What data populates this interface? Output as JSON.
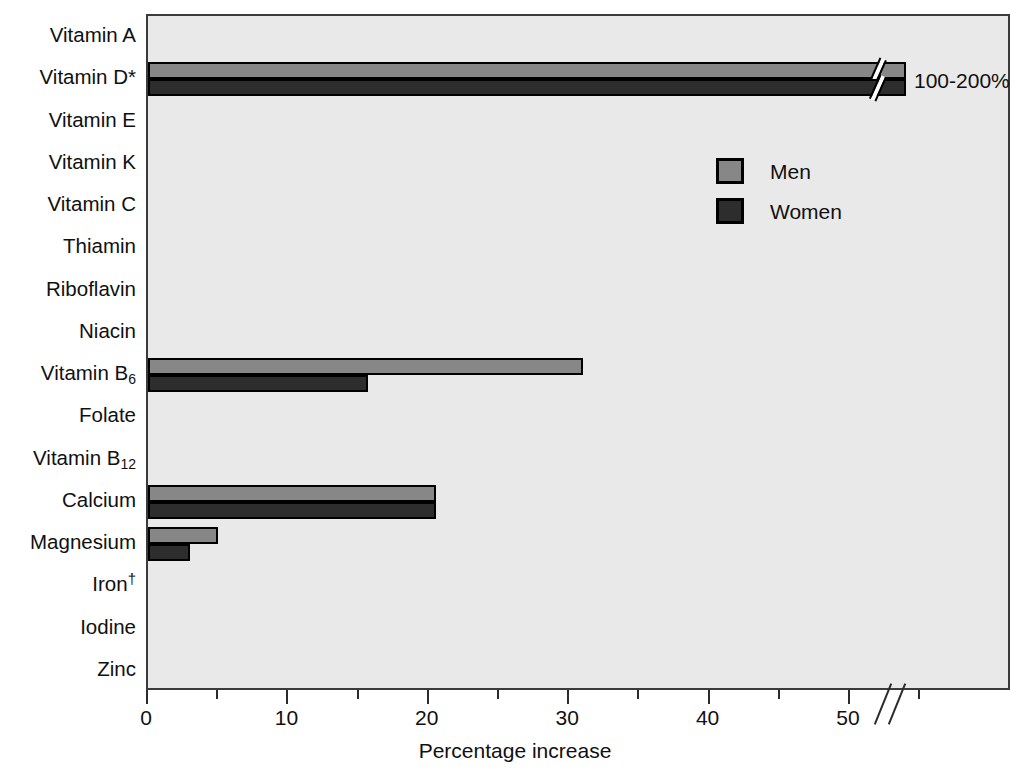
{
  "chart_data": {
    "type": "bar",
    "orientation": "horizontal",
    "title": "",
    "xlabel": "Percentage increase",
    "ylabel": "",
    "xlim": [
      0,
      54
    ],
    "xticks": [
      0,
      5,
      10,
      15,
      20,
      25,
      30,
      35,
      40,
      45,
      50
    ],
    "xtick_labels": [
      "0",
      "10",
      "20",
      "30",
      "40",
      "50"
    ],
    "xtick_label_values": [
      0,
      10,
      20,
      30,
      40,
      50
    ],
    "grid": false,
    "axis_break": {
      "at": 52,
      "label": "100-200%",
      "applies_to": "Vitamin D*"
    },
    "legend": {
      "position": "upper right",
      "entries": [
        "Men",
        "Women"
      ]
    },
    "categories": [
      "Vitamin A",
      "Vitamin D*",
      "Vitamin E",
      "Vitamin K",
      "Vitamin C",
      "Thiamin",
      "Riboflavin",
      "Niacin",
      "Vitamin B6",
      "Folate",
      "Vitamin B12",
      "Calcium",
      "Magnesium",
      "Iron†",
      "Iodine",
      "Zinc"
    ],
    "series": [
      {
        "name": "Men",
        "color": "#878787",
        "values": [
          0,
          54,
          0,
          0,
          0,
          0,
          0,
          0,
          31,
          0,
          0,
          20.5,
          5,
          0,
          0,
          0
        ]
      },
      {
        "name": "Women",
        "color": "#2d2d2d",
        "values": [
          0,
          54,
          0,
          0,
          0,
          0,
          0,
          0,
          15.7,
          0,
          0,
          20.5,
          3,
          0,
          0,
          0
        ]
      }
    ],
    "annotations": [
      {
        "text": "100-200%",
        "category": "Vitamin D*",
        "x": 54.5
      }
    ]
  },
  "categories": [
    {
      "label": "Vitamin A",
      "sub": "",
      "sup": ""
    },
    {
      "label": "Vitamin D*",
      "sub": "",
      "sup": ""
    },
    {
      "label": "Vitamin E",
      "sub": "",
      "sup": ""
    },
    {
      "label": "Vitamin K",
      "sub": "",
      "sup": ""
    },
    {
      "label": "Vitamin C",
      "sub": "",
      "sup": ""
    },
    {
      "label": "Thiamin",
      "sub": "",
      "sup": ""
    },
    {
      "label": "Riboflavin",
      "sub": "",
      "sup": ""
    },
    {
      "label": "Niacin",
      "sub": "",
      "sup": ""
    },
    {
      "label": "Vitamin B",
      "sub": "6",
      "sup": ""
    },
    {
      "label": "Folate",
      "sub": "",
      "sup": ""
    },
    {
      "label": "Vitamin B",
      "sub": "12",
      "sup": ""
    },
    {
      "label": "Calcium",
      "sub": "",
      "sup": ""
    },
    {
      "label": "Magnesium",
      "sub": "",
      "sup": ""
    },
    {
      "label": "Iron",
      "sub": "",
      "sup": "†"
    },
    {
      "label": "Iodine",
      "sub": "",
      "sup": ""
    },
    {
      "label": "Zinc",
      "sub": "",
      "sup": ""
    }
  ],
  "legend": {
    "men_label": "Men",
    "women_label": "Women",
    "men_color": "#878787",
    "women_color": "#2d2d2d"
  },
  "axis": {
    "x_title": "Percentage increase",
    "tick_labels": [
      "0",
      "10",
      "20",
      "30",
      "40",
      "50"
    ]
  },
  "annotation": {
    "vitamin_d_value": "100-200%"
  },
  "colors": {
    "plot_background": "#e9e9e9",
    "axis": "#3b3b3b",
    "men_bar": "#878787",
    "women_bar": "#2d2d2d",
    "text": "#101010"
  }
}
